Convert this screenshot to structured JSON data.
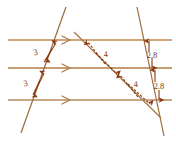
{
  "figure": {
    "type": "geometry-diagram",
    "background_color": "#ffffff",
    "parallel_line_color": "#c08a52",
    "transversal_color": "#a8753f",
    "measure_color": "#8b3a14",
    "label_color": "#7a3a18"
  },
  "parallel_lines": [
    {
      "name": "top-parallel-line",
      "y": 40,
      "x1": 8,
      "x2": 172,
      "tick_marks": 1
    },
    {
      "name": "middle-parallel-line",
      "y": 68,
      "x1": 8,
      "x2": 172,
      "tick_marks": 1
    },
    {
      "name": "bottom-parallel-line",
      "y": 100,
      "x1": 8,
      "x2": 172,
      "tick_marks": 1
    }
  ],
  "transversals": [
    {
      "name": "left-transversal",
      "x1": 66,
      "y1": 7,
      "x2": 21,
      "y2": 133
    },
    {
      "name": "right-transversal",
      "x1": 137,
      "y1": 7,
      "x2": 164,
      "y2": 136
    },
    {
      "name": "diagonal-transversal",
      "x1": 74,
      "y1": 32,
      "x2": 161,
      "y2": 118
    }
  ],
  "measures": [
    {
      "name": "left-upper-measure",
      "value": "3",
      "label_x": 36,
      "label_y": 55,
      "segment": "top-to-middle on left transversal"
    },
    {
      "name": "left-lower-measure",
      "value": "3",
      "label_x": 26,
      "label_y": 86,
      "segment": "middle-to-bottom on left transversal"
    },
    {
      "name": "diagonal-upper-measure",
      "value": "4",
      "label_x": 106,
      "label_y": 57,
      "segment": "top-to-middle on diagonal transversal"
    },
    {
      "name": "diagonal-lower-measure",
      "value": "4",
      "label_x": 136,
      "label_y": 87,
      "segment": "middle-to-bottom on diagonal transversal"
    },
    {
      "name": "right-upper-measure",
      "value": "2.8",
      "label_x": 150,
      "label_y": 58,
      "segment": "top-to-middle on right transversal"
    },
    {
      "name": "right-lower-measure",
      "value": "2.8",
      "label_x": 157,
      "label_y": 89,
      "segment": "middle-to-bottom on right transversal"
    }
  ],
  "parallel_marks": [
    {
      "name": "top-parallel-mark",
      "x": 66,
      "y": 40
    },
    {
      "name": "middle-parallel-mark",
      "x": 66,
      "y": 68
    },
    {
      "name": "bottom-parallel-mark",
      "x": 66,
      "y": 100
    }
  ]
}
